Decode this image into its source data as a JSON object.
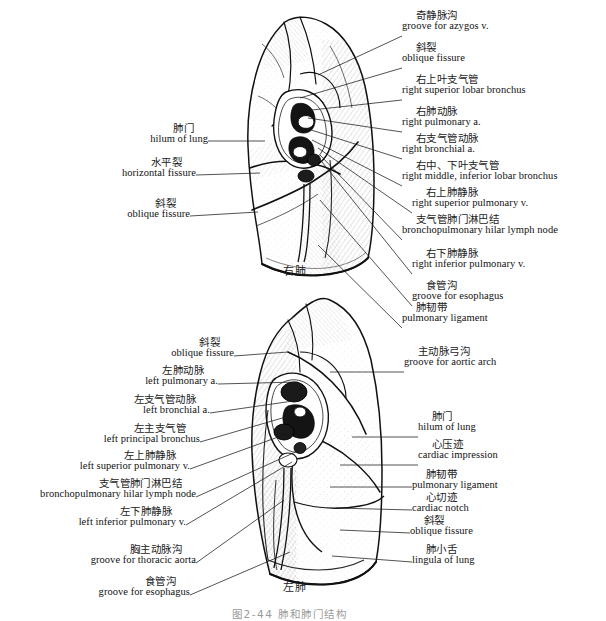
{
  "figure": {
    "caption_cn": "图2-44  肺和肺门结构",
    "upper_panel_caption": "右肺",
    "lower_panel_caption": "左肺"
  },
  "upper_panel": {
    "name": "right-lung-medial-surface",
    "right_labels": [
      {
        "cn": "奇静脉沟",
        "en": "groove for azygos v.",
        "x": 402,
        "y": 10,
        "ax": 402,
        "ay": 36,
        "bx": 318,
        "by": 75
      },
      {
        "cn": "斜裂",
        "en": "oblique fissure",
        "x": 402,
        "y": 42,
        "ax": 402,
        "ay": 68,
        "bx": 300,
        "by": 98
      },
      {
        "cn": "右上叶支气管",
        "en": "right superior lobar bronchus",
        "x": 402,
        "y": 74,
        "ax": 402,
        "ay": 100,
        "bx": 312,
        "by": 110
      },
      {
        "cn": "右肺动脉",
        "en": "right pulmonary a.",
        "x": 402,
        "y": 106,
        "ax": 402,
        "ay": 132,
        "bx": 308,
        "by": 118
      },
      {
        "cn": "右支气管动脉",
        "en": "right bronchial a.",
        "x": 402,
        "y": 133,
        "ax": 402,
        "ay": 159,
        "bx": 305,
        "by": 128
      },
      {
        "cn": "右中、下叶支气管",
        "en": "right middle, inferior lobar bronchus",
        "x": 402,
        "y": 160,
        "ax": 402,
        "ay": 186,
        "bx": 312,
        "by": 140
      },
      {
        "cn": "右上肺静脉",
        "en": "right superior pulmonary v.",
        "x": 412,
        "y": 187,
        "ax": 412,
        "ay": 213,
        "bx": 318,
        "by": 148
      },
      {
        "cn": "支气管肺门淋巴结",
        "en": "bronchopulmonary hilar lymph node",
        "x": 402,
        "y": 214,
        "ax": 402,
        "ay": 240,
        "bx": 320,
        "by": 155
      },
      {
        "cn": "右下肺静脉",
        "en": "right inferior pulmonary v.",
        "x": 412,
        "y": 248,
        "ax": 412,
        "ay": 274,
        "bx": 322,
        "by": 162
      },
      {
        "cn": "食管沟",
        "en": "groove for esophagus",
        "x": 412,
        "y": 280,
        "ax": 412,
        "ay": 306,
        "bx": 320,
        "by": 200
      },
      {
        "cn": "肺韧带",
        "en": "pulmonary ligament",
        "x": 402,
        "y": 302,
        "ax": 402,
        "ay": 328,
        "bx": 318,
        "by": 245
      }
    ],
    "left_labels": [
      {
        "cn": "肺门",
        "en": "hilum of lung",
        "x": 122,
        "y": 123,
        "ax": 208,
        "ay": 141,
        "bx": 265,
        "by": 141
      },
      {
        "cn": "水平裂",
        "en": "horizontal fissure",
        "x": 80,
        "y": 157,
        "ax": 196,
        "ay": 175,
        "bx": 260,
        "by": 173
      },
      {
        "cn": "斜裂",
        "en": "oblique fissure",
        "x": 104,
        "y": 198,
        "ax": 190,
        "ay": 216,
        "bx": 258,
        "by": 212
      }
    ]
  },
  "lower_panel": {
    "name": "left-lung-medial-surface",
    "left_labels": [
      {
        "cn": "斜裂",
        "en": "oblique fissure",
        "x": 126,
        "y": 337,
        "ax": 234,
        "ay": 356,
        "bx": 288,
        "by": 352
      },
      {
        "cn": "左肺动脉",
        "en": "left pulmonary a.",
        "x": 108,
        "y": 365,
        "ax": 218,
        "ay": 384,
        "bx": 298,
        "by": 382
      },
      {
        "cn": "左支气管动脉",
        "en": "left bronchial a.",
        "x": 104,
        "y": 394,
        "ax": 210,
        "ay": 413,
        "bx": 300,
        "by": 400
      },
      {
        "cn": "左主支气管",
        "en": "left principal bronchus",
        "x": 88,
        "y": 423,
        "ax": 200,
        "ay": 442,
        "bx": 296,
        "by": 414
      },
      {
        "cn": "左上肺静脉",
        "en": "left superior pulmonary v.",
        "x": 70,
        "y": 450,
        "ax": 190,
        "ay": 469,
        "bx": 292,
        "by": 432
      },
      {
        "cn": "支气管肺门淋巴结",
        "en": "bronchopulmonary hilar lymph node",
        "x": 22,
        "y": 478,
        "ax": 196,
        "ay": 497,
        "bx": 300,
        "by": 450
      },
      {
        "cn": "左下肺静脉",
        "en": "left inferior pulmonary v.",
        "x": 62,
        "y": 506,
        "ax": 186,
        "ay": 525,
        "bx": 292,
        "by": 462
      },
      {
        "cn": "胸主动脉沟",
        "en": "groove for thoracic aorta",
        "x": 60,
        "y": 544,
        "ax": 196,
        "ay": 563,
        "bx": 284,
        "by": 500
      },
      {
        "cn": "食管沟",
        "en": "groove for esophagus",
        "x": 90,
        "y": 576,
        "ax": 190,
        "ay": 595,
        "bx": 290,
        "by": 552
      }
    ],
    "right_labels": [
      {
        "cn": "主动脉弓沟",
        "en": "groove for aortic arch",
        "x": 404,
        "y": 346,
        "ax": 404,
        "ay": 372,
        "bx": 330,
        "by": 372
      },
      {
        "cn": "肺门",
        "en": "hilum of lung",
        "x": 418,
        "y": 411,
        "ax": 418,
        "ay": 437,
        "bx": 352,
        "by": 437
      },
      {
        "cn": "心压迹",
        "en": "cardiac impression",
        "x": 418,
        "y": 439,
        "ax": 418,
        "ay": 465,
        "bx": 340,
        "by": 465
      },
      {
        "cn": "肺韧带",
        "en": "pulmonary ligament",
        "x": 412,
        "y": 469,
        "ax": 412,
        "ay": 487,
        "bx": 330,
        "by": 487
      },
      {
        "cn": "心切迹",
        "en": "cardiac notch",
        "x": 412,
        "y": 492,
        "ax": 412,
        "ay": 510,
        "bx": 336,
        "by": 508
      },
      {
        "cn": "斜裂",
        "en": "oblique fissure",
        "x": 410,
        "y": 515,
        "ax": 410,
        "ay": 533,
        "bx": 340,
        "by": 530
      },
      {
        "cn": "肺小舌",
        "en": "lingula of lung",
        "x": 412,
        "y": 544,
        "ax": 412,
        "ay": 562,
        "bx": 332,
        "by": 556
      }
    ]
  }
}
